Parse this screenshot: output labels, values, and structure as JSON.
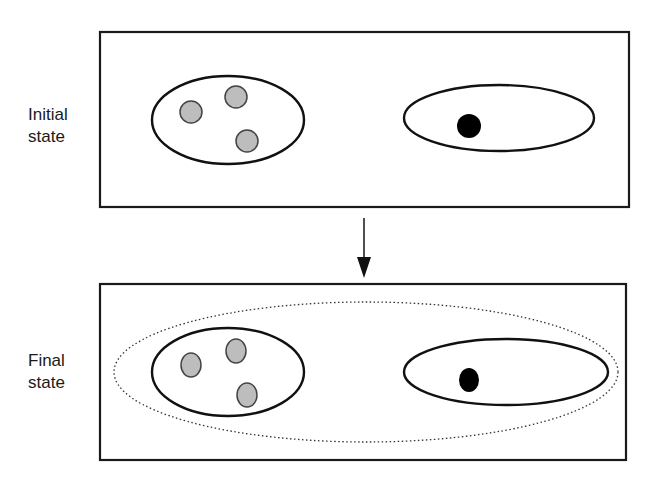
{
  "diagram": {
    "arrow_direction": "down",
    "panels": [
      {
        "id": "initial",
        "label_lines": [
          "Initial",
          "state"
        ],
        "groups": [
          {
            "particles": [
              {
                "color": "#bdbdbd",
                "kind": "gray-particle"
              },
              {
                "color": "#bdbdbd",
                "kind": "gray-particle"
              },
              {
                "color": "#bdbdbd",
                "kind": "gray-particle"
              }
            ]
          },
          {
            "particles": [
              {
                "color": "#000000",
                "kind": "black-particle"
              }
            ]
          }
        ],
        "enclosing_dotted_group": false
      },
      {
        "id": "final",
        "label_lines": [
          "Final",
          "state"
        ],
        "groups": [
          {
            "particles": [
              {
                "color": "#bdbdbd",
                "kind": "gray-particle"
              },
              {
                "color": "#bdbdbd",
                "kind": "gray-particle"
              },
              {
                "color": "#bdbdbd",
                "kind": "gray-particle"
              }
            ]
          },
          {
            "particles": [
              {
                "color": "#000000",
                "kind": "black-particle"
              }
            ]
          }
        ],
        "enclosing_dotted_group": true
      }
    ]
  }
}
